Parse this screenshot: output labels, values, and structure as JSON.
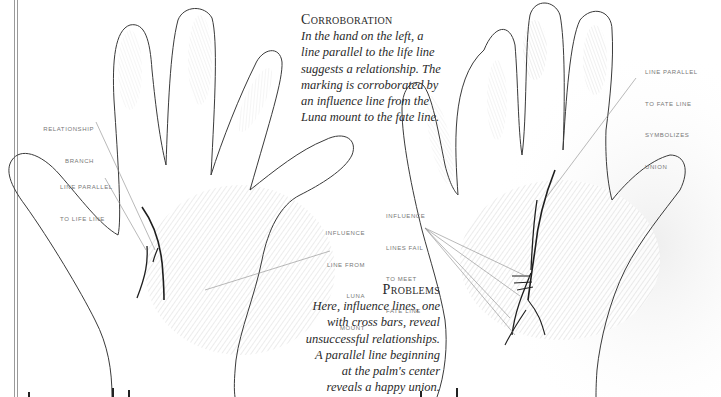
{
  "corroboration": {
    "title": "Corroboration",
    "lines": [
      "In the hand on the left, a",
      "line parallel to the life line",
      "suggests a relationship. The",
      "marking is corroborated by",
      "an influence line from the",
      "Luna mount to the fate line."
    ]
  },
  "problems": {
    "title": "Problems",
    "lines": [
      "Here, influence lines, one",
      "with cross bars, reveal",
      "unsuccessful relationships.",
      "A parallel line beginning",
      "at the palm's center",
      "reveals a happy union."
    ]
  },
  "left_hand_labels": {
    "relationship_branch": [
      "RELATIONSHIP",
      "BRANCH"
    ],
    "line_parallel_life": [
      "LINE PARALLEL",
      "TO LIFE LINE"
    ],
    "influence_luna": [
      "INFLUENCE",
      "LINE FROM",
      "LUNA",
      "MOUNT"
    ]
  },
  "right_hand_labels": {
    "influence_fail": [
      "INFLUENCE",
      "LINES FAIL",
      "TO MEET",
      "FATE LINE"
    ],
    "parallel_fate": [
      "LINE PARALLEL",
      "TO FATE LINE",
      "SYMBOLIZES",
      "UNION"
    ]
  },
  "colors": {
    "outline": "#3a3a3a",
    "palm_line": "#1e1e1e",
    "leader": "#8a8a8a",
    "label_text": "#777777",
    "body_text": "#2a2a2a",
    "print_shading": "#d8d8d8"
  }
}
